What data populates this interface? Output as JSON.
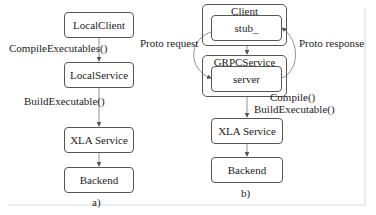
{
  "panel_a": {
    "caption": "a)",
    "nodes": [
      {
        "label": "LocalClient"
      },
      {
        "label": "LocalService"
      },
      {
        "label": "XLA Service"
      },
      {
        "label": "Backend"
      }
    ],
    "edges": [
      {
        "from": "LocalClient",
        "to": "LocalService",
        "label": "CompileExecutables()"
      },
      {
        "from": "LocalService",
        "to": "XLA Service",
        "label": "BuildExecutable()"
      },
      {
        "from": "XLA Service",
        "to": "Backend",
        "label": ""
      }
    ]
  },
  "panel_b": {
    "caption": "b)",
    "groups": [
      {
        "title": "Client",
        "inner": "stub_"
      },
      {
        "title": "GRPCService",
        "inner": "server"
      }
    ],
    "nodes": [
      {
        "label": "XLA Service"
      },
      {
        "label": "Backend"
      }
    ],
    "edges": [
      {
        "from": "Client",
        "to": "GRPCService",
        "label": ""
      },
      {
        "from": "stub_",
        "to": "server",
        "label": "Proto request"
      },
      {
        "from": "server",
        "to": "stub_",
        "label": "Proto response"
      },
      {
        "from": "GRPCService",
        "to": "XLA Service",
        "label_line1": "Compile()",
        "label_line2": "BuildExecutable()"
      },
      {
        "from": "XLA Service",
        "to": "Backend",
        "label": ""
      }
    ]
  },
  "colors": {
    "stroke": "#555555",
    "text": "#222222",
    "frame": "#ececec"
  }
}
